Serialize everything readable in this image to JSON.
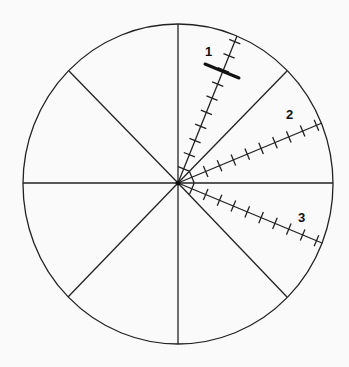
{
  "diagram": {
    "center": [
      178,
      184
    ],
    "radius_x": 155,
    "radius_y": 160,
    "stroke_color": "#222222",
    "divider_angles_deg": [
      0,
      45,
      90,
      135,
      180,
      225,
      270,
      315
    ],
    "rays": [
      {
        "label": "1",
        "angle_deg": 68,
        "ticks": 10
      },
      {
        "label": "2",
        "angle_deg": 25,
        "ticks": 10
      },
      {
        "label": "3",
        "angle_deg": -22,
        "ticks": 10
      }
    ],
    "marker": {
      "label": "bar-mark-on-ray-1"
    }
  }
}
